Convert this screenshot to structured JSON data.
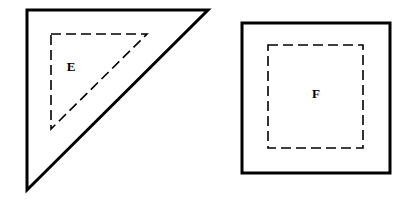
{
  "figure": {
    "background_color": "#ffffff",
    "stroke_color": "#000000",
    "outer_stroke_width": 3,
    "dashed_stroke_width": 1.6,
    "dash_pattern": "10 5",
    "shapes": [
      {
        "id": "shape-e",
        "label": "E",
        "outer_type": "right-triangle",
        "outer_style": "solid",
        "outer_points": "27,10 208,10 27,190",
        "inner_type": "right-triangle",
        "inner_style": "dashed",
        "inner_points": "51,34 147,34 51,129",
        "label_x": 71,
        "label_y": 68
      },
      {
        "id": "shape-f",
        "label": "F",
        "outer_type": "square",
        "outer_style": "solid",
        "outer_x": 242,
        "outer_y": 23,
        "outer_width": 148,
        "outer_height": 150,
        "inner_type": "square",
        "inner_style": "dashed",
        "inner_x": 268,
        "inner_y": 45,
        "inner_width": 95,
        "inner_height": 103,
        "label_x": 316,
        "label_y": 95
      }
    ]
  }
}
